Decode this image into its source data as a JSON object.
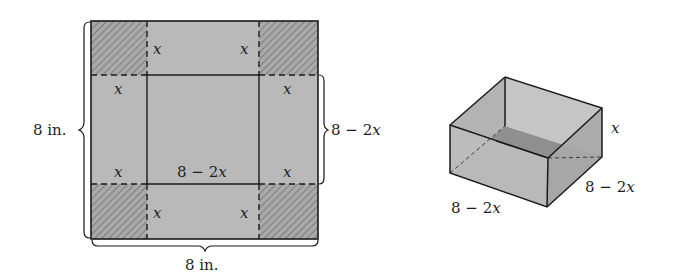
{
  "colors": {
    "panel_fill": "#b8b8b8",
    "corner_fill": "#a8a8a8",
    "hatch": "#888888",
    "line": "#1a1a1a",
    "box_front": "#bdbdbd",
    "box_side": "#a9a9a9",
    "box_inner_back": "#c6c6c6",
    "box_inner_left": "#b4b4b4",
    "box_floor": "#8e8e8e"
  },
  "flat_sheet": {
    "corner_labels": {
      "top_left": "x",
      "top_right": "x",
      "left_top": "x",
      "right_top": "x",
      "left_bottom": "x",
      "right_bottom": "x",
      "bottom_left": "x",
      "bottom_right": "x"
    },
    "center_label_num": "8 − 2",
    "center_label_var": "x",
    "height_label": "8 in.",
    "width_label": "8 in.",
    "inner_side_label_num": "8 − 2",
    "inner_side_label_var": "x"
  },
  "box": {
    "height_label": "x",
    "depth_label_num": "8 − 2",
    "depth_label_var": "x",
    "width_label_num": "8 − 2",
    "width_label_var": "x"
  }
}
